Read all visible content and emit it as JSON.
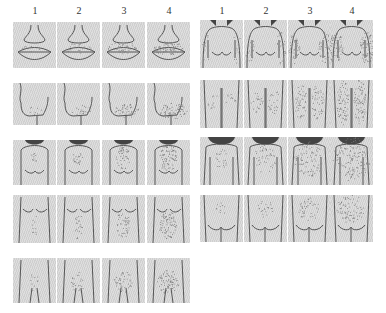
{
  "scores": [
    "1",
    "2",
    "3",
    "4"
  ],
  "left_block": {
    "rows": [
      {
        "region": "upper-lip",
        "y": 22,
        "h": 46
      },
      {
        "region": "chin",
        "y": 83,
        "h": 42
      },
      {
        "region": "chest",
        "y": 140,
        "h": 45
      },
      {
        "region": "upper-abdomen",
        "y": 195,
        "h": 48
      },
      {
        "region": "lower-abdomen",
        "y": 258,
        "h": 45
      }
    ],
    "columns_x": [
      13,
      57,
      102,
      147
    ]
  },
  "right_block": {
    "rows": [
      {
        "region": "upper-arm",
        "y": 20,
        "h": 48
      },
      {
        "region": "thigh",
        "y": 80,
        "h": 48
      },
      {
        "region": "upper-back",
        "y": 137,
        "h": 48
      },
      {
        "region": "lower-back",
        "y": 195,
        "h": 47
      }
    ],
    "columns_x": [
      200,
      244,
      288,
      330
    ]
  },
  "colors": {
    "panel_bg": "#d8d8d8",
    "line": "#555555",
    "hair": "#7a7a7a",
    "hair_dark": "#444444"
  }
}
